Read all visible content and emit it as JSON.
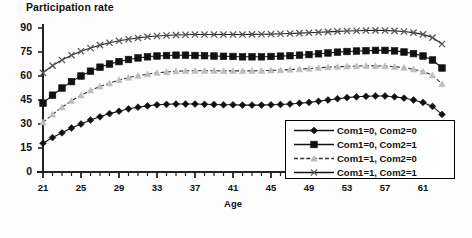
{
  "chart_data": {
    "type": "line",
    "title": "Participation rate",
    "xlabel": "Age",
    "ylabel": "",
    "xlim": [
      21,
      63
    ],
    "ylim": [
      0,
      90
    ],
    "ytick_step": 15,
    "yticks": [
      0,
      15,
      30,
      45,
      60,
      75,
      90
    ],
    "xticks": [
      21,
      25,
      29,
      33,
      37,
      41,
      45,
      49,
      53,
      57,
      61
    ],
    "xtick_minor_step": 1,
    "grid": false,
    "legend_position": "lower-right-inside",
    "x": [
      21,
      22,
      23,
      24,
      25,
      26,
      27,
      28,
      29,
      30,
      31,
      32,
      33,
      34,
      35,
      36,
      37,
      38,
      39,
      40,
      41,
      42,
      43,
      44,
      45,
      46,
      47,
      48,
      49,
      50,
      51,
      52,
      53,
      54,
      55,
      56,
      57,
      58,
      59,
      60,
      61,
      62,
      63
    ],
    "series": [
      {
        "name": "Com1=0, Com2=0",
        "marker": "diamond",
        "color": "#111111",
        "line_color": "#111111",
        "line_style": "solid",
        "values": [
          18.0,
          21.5,
          24.5,
          27.5,
          30.0,
          32.5,
          34.5,
          36.5,
          38.0,
          39.5,
          40.5,
          41.3,
          42.0,
          42.3,
          42.5,
          42.5,
          42.5,
          42.3,
          42.2,
          42.0,
          42.0,
          41.8,
          41.8,
          41.8,
          42.0,
          42.2,
          42.5,
          43.0,
          43.5,
          44.2,
          45.0,
          45.8,
          46.5,
          47.0,
          47.3,
          47.5,
          47.5,
          47.0,
          46.2,
          45.0,
          43.5,
          41.0,
          36.0
        ]
      },
      {
        "name": "Com1=0, Com2=1",
        "marker": "square",
        "color": "#111111",
        "line_color": "#111111",
        "line_style": "solid",
        "values": [
          43.0,
          48.0,
          52.5,
          56.5,
          60.0,
          63.0,
          65.5,
          67.5,
          69.0,
          70.3,
          71.3,
          72.0,
          72.5,
          72.8,
          73.0,
          73.0,
          72.8,
          72.7,
          72.5,
          72.3,
          72.2,
          72.0,
          72.0,
          72.0,
          72.2,
          72.4,
          72.7,
          73.0,
          73.4,
          73.9,
          74.4,
          74.9,
          75.3,
          75.6,
          75.8,
          76.0,
          76.0,
          75.7,
          75.0,
          74.0,
          72.5,
          70.0,
          65.0
        ]
      },
      {
        "name": "Com1=1, Com2=0",
        "marker": "triangle",
        "color": "#bdbdbd",
        "line_color": "#333333",
        "line_style": "dashed",
        "values": [
          31.0,
          36.0,
          40.5,
          44.5,
          48.0,
          51.0,
          53.5,
          55.5,
          57.5,
          59.0,
          60.2,
          61.2,
          62.0,
          62.5,
          63.0,
          63.2,
          63.3,
          63.3,
          63.3,
          63.2,
          63.2,
          63.2,
          63.2,
          63.3,
          63.5,
          63.7,
          64.0,
          64.3,
          64.7,
          65.1,
          65.5,
          65.8,
          66.0,
          66.2,
          66.3,
          66.3,
          66.2,
          65.8,
          65.2,
          64.2,
          62.8,
          60.5,
          55.0
        ]
      },
      {
        "name": "Com1=1, Com2=1",
        "marker": "x",
        "color": "#555555",
        "line_color": "#222222",
        "line_style": "solid",
        "values": [
          62.0,
          66.5,
          70.0,
          73.0,
          75.5,
          77.5,
          79.3,
          80.8,
          82.0,
          83.0,
          83.8,
          84.5,
          85.0,
          85.3,
          85.6,
          85.8,
          85.9,
          85.9,
          85.9,
          85.9,
          85.9,
          85.9,
          86.0,
          86.1,
          86.2,
          86.4,
          86.6,
          86.8,
          87.0,
          87.3,
          87.6,
          87.9,
          88.1,
          88.3,
          88.4,
          88.5,
          88.4,
          88.2,
          87.8,
          87.1,
          86.0,
          84.0,
          80.0
        ]
      }
    ]
  },
  "legend": {
    "items": [
      {
        "label": "Com1=0, Com2=0"
      },
      {
        "label": "Com1=0, Com2=1"
      },
      {
        "label": "Com1=1, Com2=0"
      },
      {
        "label": "Com1=1, Com2=1"
      }
    ]
  }
}
